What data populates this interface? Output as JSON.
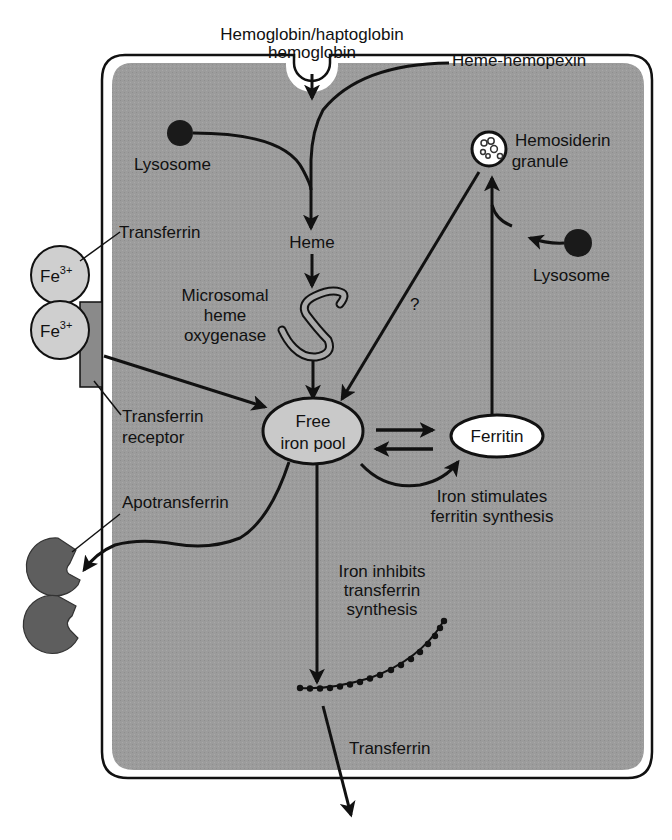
{
  "diagram": {
    "colors": {
      "cytoplasm": "#9c9c9c",
      "outline": "#111111",
      "transferrin_fill": "#cfcfcf",
      "apotransferrin_fill": "#5e5e5e",
      "lysosome_fill": "#1a1a1a",
      "free_iron_pool_fill": "#c9c9c9",
      "ferritin_fill": "#ffffff",
      "receptor_fill": "#8a8a8a"
    },
    "labels": {
      "hemoglobin_line1": "Hemoglobin/haptoglobin",
      "hemoglobin_line2": "hemoglobin",
      "heme_hemopexin": "Heme-hemopexin",
      "lysosome_left": "Lysosome",
      "hemosiderin_line1": "Hemosiderin",
      "hemosiderin_line2": "granule",
      "transferrin_top": "Transferrin",
      "heme": "Heme",
      "lysosome_right": "Lysosome",
      "fe_ion": "Fe",
      "fe_charge": "3+",
      "microsomal_line1": "Microsomal",
      "microsomal_line2": "heme",
      "microsomal_line3": "oxygenase",
      "question_mark": "?",
      "transferrin_receptor_line1": "Transferrin",
      "transferrin_receptor_line2": "receptor",
      "free_iron_line1": "Free",
      "free_iron_line2": "iron pool",
      "ferritin": "Ferritin",
      "apotransferrin": "Apotransferrin",
      "iron_stimulates_line1": "Iron stimulates",
      "iron_stimulates_line2": "ferritin synthesis",
      "iron_inhibits_line1": "Iron inhibits",
      "iron_inhibits_line2": "transferrin",
      "iron_inhibits_line3": "synthesis",
      "transferrin_bottom": "Transferrin"
    },
    "nodes": [
      {
        "id": "hemoglobin",
        "label": "Hemoglobin/haptoglobin hemoglobin"
      },
      {
        "id": "heme-hemopexin",
        "label": "Heme-hemopexin"
      },
      {
        "id": "lysosome-left",
        "label": "Lysosome"
      },
      {
        "id": "heme",
        "label": "Heme"
      },
      {
        "id": "microsomal-heme-oxygenase",
        "label": "Microsomal heme oxygenase"
      },
      {
        "id": "transferrin-fe",
        "label": "Transferrin (Fe3+)"
      },
      {
        "id": "transferrin-receptor",
        "label": "Transferrin receptor"
      },
      {
        "id": "free-iron-pool",
        "label": "Free iron pool"
      },
      {
        "id": "ferritin",
        "label": "Ferritin"
      },
      {
        "id": "hemosiderin-granule",
        "label": "Hemosiderin granule"
      },
      {
        "id": "lysosome-right",
        "label": "Lysosome"
      },
      {
        "id": "apotransferrin",
        "label": "Apotransferrin"
      },
      {
        "id": "transferrin-synthesis",
        "label": "Transferrin"
      }
    ],
    "edges": [
      {
        "from": "hemoglobin",
        "to": "heme"
      },
      {
        "from": "heme-hemopexin",
        "to": "heme"
      },
      {
        "from": "lysosome-left",
        "to": "heme"
      },
      {
        "from": "heme",
        "to": "microsomal-heme-oxygenase"
      },
      {
        "from": "microsomal-heme-oxygenase",
        "to": "free-iron-pool"
      },
      {
        "from": "transferrin-receptor",
        "to": "free-iron-pool"
      },
      {
        "from": "hemosiderin-granule",
        "to": "free-iron-pool",
        "label": "?"
      },
      {
        "from": "free-iron-pool",
        "to": "ferritin"
      },
      {
        "from": "ferritin",
        "to": "free-iron-pool"
      },
      {
        "from": "free-iron-pool",
        "to": "ferritin",
        "label": "Iron stimulates ferritin synthesis"
      },
      {
        "from": "ferritin",
        "to": "hemosiderin-granule"
      },
      {
        "from": "lysosome-right",
        "to": "hemosiderin-granule"
      },
      {
        "from": "free-iron-pool",
        "to": "apotransferrin"
      },
      {
        "from": "free-iron-pool",
        "to": "transferrin-synthesis",
        "label": "Iron inhibits transferrin synthesis"
      }
    ]
  }
}
